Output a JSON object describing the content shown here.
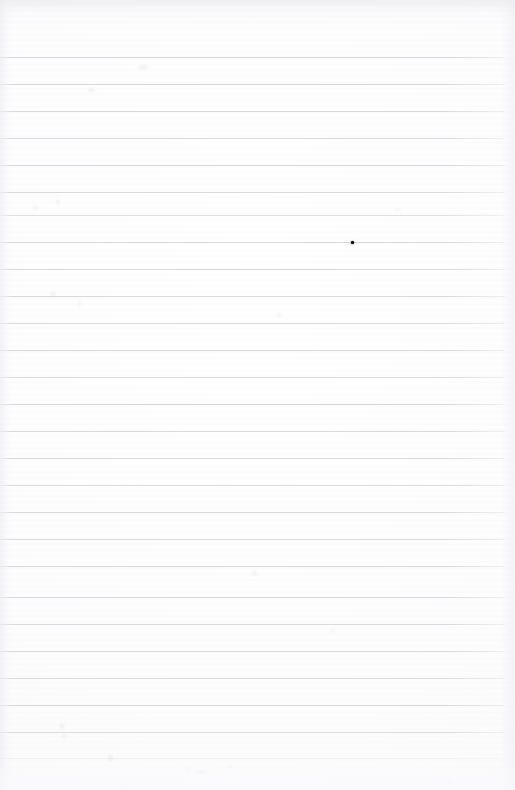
{
  "document": {
    "title": "Scanned ruled notebook page",
    "kind": "blank-lined-paper-scan",
    "width_px": 515,
    "height_px": 790,
    "page_text": "",
    "visible_text_content": "none",
    "paper_color": "#fdfdfd",
    "rule_line_color": "#d4d4da",
    "ink_color": "#0b0b0b"
  },
  "layout": {
    "top_margin_px": 57,
    "bottom_margin_px": 32,
    "left_rule_start_x": 0,
    "right_rule_end_x": 505,
    "line_spacing_px": 26.9,
    "line_count": 26
  },
  "ruled_lines": [
    {
      "index": 1,
      "y": 57,
      "opacity": 0.95
    },
    {
      "index": 2,
      "y": 84,
      "opacity": 0.92
    },
    {
      "index": 3,
      "y": 111,
      "opacity": 0.9
    },
    {
      "index": 4,
      "y": 138,
      "opacity": 0.88
    },
    {
      "index": 5,
      "y": 165,
      "opacity": 0.95
    },
    {
      "index": 6,
      "y": 192,
      "opacity": 0.9
    },
    {
      "index": 7,
      "y": 215,
      "opacity": 0.72
    },
    {
      "index": 8,
      "y": 242,
      "opacity": 0.95
    },
    {
      "index": 9,
      "y": 269,
      "opacity": 0.9
    },
    {
      "index": 10,
      "y": 296,
      "opacity": 0.92
    },
    {
      "index": 11,
      "y": 323,
      "opacity": 0.88
    },
    {
      "index": 12,
      "y": 350,
      "opacity": 0.9
    },
    {
      "index": 13,
      "y": 377,
      "opacity": 0.86
    },
    {
      "index": 14,
      "y": 404,
      "opacity": 0.95
    },
    {
      "index": 15,
      "y": 431,
      "opacity": 0.9
    },
    {
      "index": 16,
      "y": 458,
      "opacity": 0.92
    },
    {
      "index": 17,
      "y": 485,
      "opacity": 0.88
    },
    {
      "index": 18,
      "y": 512,
      "opacity": 0.9
    },
    {
      "index": 19,
      "y": 539,
      "opacity": 0.86
    },
    {
      "index": 20,
      "y": 566,
      "opacity": 0.92
    },
    {
      "index": 21,
      "y": 597,
      "opacity": 0.9
    },
    {
      "index": 22,
      "y": 624,
      "opacity": 0.88
    },
    {
      "index": 23,
      "y": 651,
      "opacity": 0.9
    },
    {
      "index": 24,
      "y": 678,
      "opacity": 0.86
    },
    {
      "index": 25,
      "y": 705,
      "opacity": 0.9
    },
    {
      "index": 26,
      "y": 732,
      "opacity": 0.82
    },
    {
      "index": 27,
      "y": 758,
      "opacity": 0.34
    }
  ],
  "marks": {
    "ink_dot": {
      "label": "ink dot",
      "x": 351,
      "y": 241,
      "size_px": 3,
      "color": "#0b0b0b"
    },
    "smudges": [
      {
        "x": 138,
        "y": 66,
        "w": 10,
        "h": 3,
        "opacity": 0.22
      },
      {
        "x": 88,
        "y": 88,
        "w": 7,
        "h": 4,
        "opacity": 0.16
      },
      {
        "x": 33,
        "y": 205,
        "w": 5,
        "h": 5,
        "opacity": 0.14
      },
      {
        "x": 56,
        "y": 199,
        "w": 4,
        "h": 6,
        "opacity": 0.13
      },
      {
        "x": 50,
        "y": 292,
        "w": 6,
        "h": 5,
        "opacity": 0.15
      },
      {
        "x": 78,
        "y": 299,
        "w": 3,
        "h": 8,
        "opacity": 0.12
      },
      {
        "x": 277,
        "y": 313,
        "w": 5,
        "h": 4,
        "opacity": 0.12
      },
      {
        "x": 395,
        "y": 208,
        "w": 6,
        "h": 4,
        "opacity": 0.1
      },
      {
        "x": 252,
        "y": 571,
        "w": 5,
        "h": 5,
        "opacity": 0.14
      },
      {
        "x": 330,
        "y": 629,
        "w": 5,
        "h": 4,
        "opacity": 0.12
      },
      {
        "x": 60,
        "y": 723,
        "w": 4,
        "h": 7,
        "opacity": 0.16
      },
      {
        "x": 62,
        "y": 733,
        "w": 4,
        "h": 5,
        "opacity": 0.14
      },
      {
        "x": 108,
        "y": 755,
        "w": 5,
        "h": 6,
        "opacity": 0.18
      },
      {
        "x": 196,
        "y": 770,
        "w": 9,
        "h": 4,
        "opacity": 0.16
      },
      {
        "x": 186,
        "y": 767,
        "w": 5,
        "h": 3,
        "opacity": 0.12
      },
      {
        "x": 228,
        "y": 765,
        "w": 4,
        "h": 4,
        "opacity": 0.1
      },
      {
        "x": 124,
        "y": 783,
        "w": 5,
        "h": 4,
        "opacity": 0.12
      },
      {
        "x": 447,
        "y": 781,
        "w": 6,
        "h": 4,
        "opacity": 0.1
      }
    ]
  }
}
